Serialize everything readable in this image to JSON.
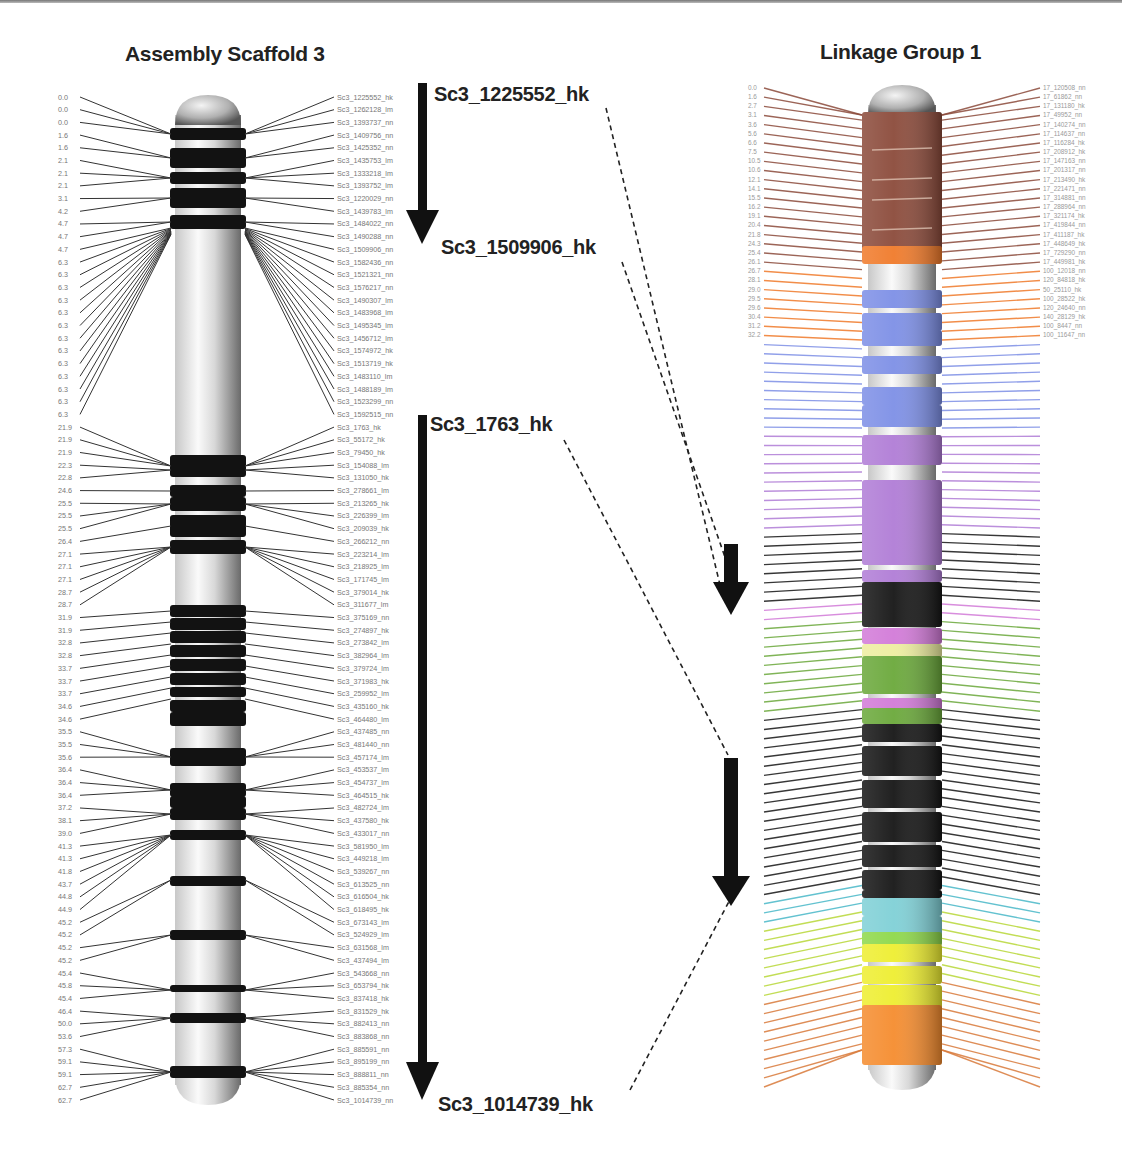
{
  "titles": {
    "left": "Assembly Scaffold 3",
    "right": "Linkage Group 1"
  },
  "markers": [
    {
      "id": "m1",
      "label": "Sc3_1225552_hk"
    },
    {
      "id": "m2",
      "label": "Sc3_1509906_hk"
    },
    {
      "id": "m3",
      "label": "Sc3_1763_hk"
    },
    {
      "id": "m4",
      "label": "Sc3_1014739_hk"
    }
  ],
  "colors": {
    "band_dark": "#111111",
    "chrom_light": "#e8e8e8",
    "brown": "#8b4a3a",
    "orange": "#f07a2a",
    "blue": "#7d8fe6",
    "violet": "#b07cd6",
    "black": "#151515",
    "pink": "#d27ad8",
    "yellow_pale": "#eeeea0",
    "green": "#6aa83a",
    "cyan": "#7fd0d6",
    "lime": "#8ed84a",
    "yellow": "#eeee30",
    "orange2": "#f58c2e"
  },
  "scaffold3": {
    "positions": [
      "0.0",
      "0.0",
      "0.0",
      "1.6",
      "1.6",
      "2.1",
      "2.1",
      "2.1",
      "3.1",
      "4.2",
      "4.7",
      "4.7",
      "4.7",
      "6.3",
      "6.3",
      "6.3",
      "6.3",
      "6.3",
      "6.3",
      "6.3",
      "6.3",
      "6.3",
      "6.3",
      "6.3",
      "6.3",
      "6.3",
      "21.9",
      "21.9",
      "21.9",
      "22.3",
      "22.8",
      "24.6",
      "25.5",
      "25.5",
      "25.5",
      "26.4",
      "27.1",
      "27.1",
      "27.1",
      "28.7",
      "28.7",
      "31.9",
      "31.9",
      "32.8",
      "32.8",
      "33.7",
      "33.7",
      "33.7",
      "34.6",
      "34.6",
      "35.5",
      "35.5",
      "35.6",
      "36.4",
      "36.4",
      "36.4",
      "37.2",
      "38.1",
      "39.0",
      "41.3",
      "41.3",
      "41.8",
      "43.7",
      "44.8",
      "44.9",
      "45.2",
      "45.2",
      "45.2",
      "45.2",
      "45.4",
      "45.8",
      "45.4",
      "46.4",
      "50.0",
      "53.6",
      "57.3",
      "59.1",
      "59.1",
      "62.7",
      "62.7"
    ],
    "markers": [
      "Sc3_1225552_hk",
      "Sc3_1262128_lm",
      "Sc3_1393737_nn",
      "Sc3_1409756_nn",
      "Sc3_1425352_nn",
      "Sc3_1435753_lm",
      "Sc3_1333218_lm",
      "Sc3_1393752_lm",
      "Sc3_1220029_nn",
      "Sc3_1439783_lm",
      "Sc3_1484022_nn",
      "Sc3_1490288_nn",
      "Sc3_1509906_nn",
      "Sc3_1582436_nn",
      "Sc3_1521321_nn",
      "Sc3_1576217_nn",
      "Sc3_1490307_lm",
      "Sc3_1483968_lm",
      "Sc3_1495345_lm",
      "Sc3_1456712_lm",
      "Sc3_1574972_hk",
      "Sc3_1513719_hk",
      "Sc3_1483110_lm",
      "Sc3_1488189_lm",
      "Sc3_1523299_nn",
      "Sc3_1592515_nn",
      "Sc3_1763_hk",
      "Sc3_55172_hk",
      "Sc3_79450_hk",
      "Sc3_154088_lm",
      "Sc3_131050_hk",
      "Sc3_278661_lm",
      "Sc3_213265_hk",
      "Sc3_226399_lm",
      "Sc3_209039_hk",
      "Sc3_266212_nn",
      "Sc3_223214_lm",
      "Sc3_218925_lm",
      "Sc3_171745_lm",
      "Sc3_379014_hk",
      "Sc3_311677_lm",
      "Sc3_375169_nn",
      "Sc3_274897_hk",
      "Sc3_273842_lm",
      "Sc3_382964_lm",
      "Sc3_379724_lm",
      "Sc3_371983_hk",
      "Sc3_259952_lm",
      "Sc3_435160_hk",
      "Sc3_464480_lm",
      "Sc3_437485_nn",
      "Sc3_481440_nn",
      "Sc3_457174_lm",
      "Sc3_453537_lm",
      "Sc3_454737_lm",
      "Sc3_464515_hk",
      "Sc3_482724_lm",
      "Sc3_437580_hk",
      "Sc3_433017_nn",
      "Sc3_581950_lm",
      "Sc3_449218_lm",
      "Sc3_539267_nn",
      "Sc3_613525_nn",
      "Sc3_616504_hk",
      "Sc3_618495_hk",
      "Sc3_673143_lm",
      "Sc3_524929_lm",
      "Sc3_631568_lm",
      "Sc3_437494_lm",
      "Sc3_543668_nn",
      "Sc3_653794_hk",
      "Sc3_837418_hk",
      "Sc3_831529_hk",
      "Sc3_882413_nn",
      "Sc3_883868_nn",
      "Sc3_885591_nn",
      "Sc3_895199_nn",
      "Sc3_888811_nn",
      "Sc3_885354_nn",
      "Sc3_1014739_nn"
    ]
  },
  "linkage1": {
    "segments": [
      {
        "color": "#8b4a3a",
        "count": 20
      },
      {
        "color": "#f07a2a",
        "count": 8
      },
      {
        "color": "#7d8fe6",
        "count": 10
      },
      {
        "color": "#b07cd6",
        "count": 11
      },
      {
        "color": "#151515",
        "count": 8
      },
      {
        "color": "#d27ad8",
        "count": 2
      },
      {
        "color": "#6aa83a",
        "count": 10
      },
      {
        "color": "#151515",
        "count": 20
      },
      {
        "color": "#48b8c8",
        "count": 3
      },
      {
        "color": "#b8d838",
        "count": 8
      },
      {
        "color": "#d97a3a",
        "count": 10
      }
    ],
    "top_positions": [
      "0.0",
      "1.6",
      "2.7",
      "3.1",
      "3.6",
      "5.6",
      "6.6",
      "7.5",
      "10.5",
      "10.6",
      "12.1",
      "14.1",
      "15.5",
      "16.2",
      "19.1",
      "20.4",
      "21.8",
      "24.3",
      "25.4",
      "26.1",
      "26.7",
      "28.1",
      "29.0",
      "29.5",
      "29.6",
      "30.4",
      "31.2",
      "32.2"
    ],
    "top_markers": [
      "17_120508_nn",
      "17_61862_nn",
      "17_131180_hk",
      "17_49952_nn",
      "17_140274_nn",
      "17_114637_nn",
      "17_116284_hk",
      "17_208912_hk",
      "17_147163_nn",
      "17_201317_nn",
      "17_213490_hk",
      "17_221471_nn",
      "17_314881_nn",
      "17_288964_nn",
      "17_321174_hk",
      "17_419844_nn",
      "17_411187_hk",
      "17_448649_hk",
      "17_729290_nn",
      "17_449981_hk",
      "100_12018_nn",
      "120_84818_hk",
      "50_25110_hk",
      "100_28522_hk",
      "120_24640_nn",
      "140_28129_hk",
      "100_8447_nn",
      "100_11647_nn"
    ]
  }
}
